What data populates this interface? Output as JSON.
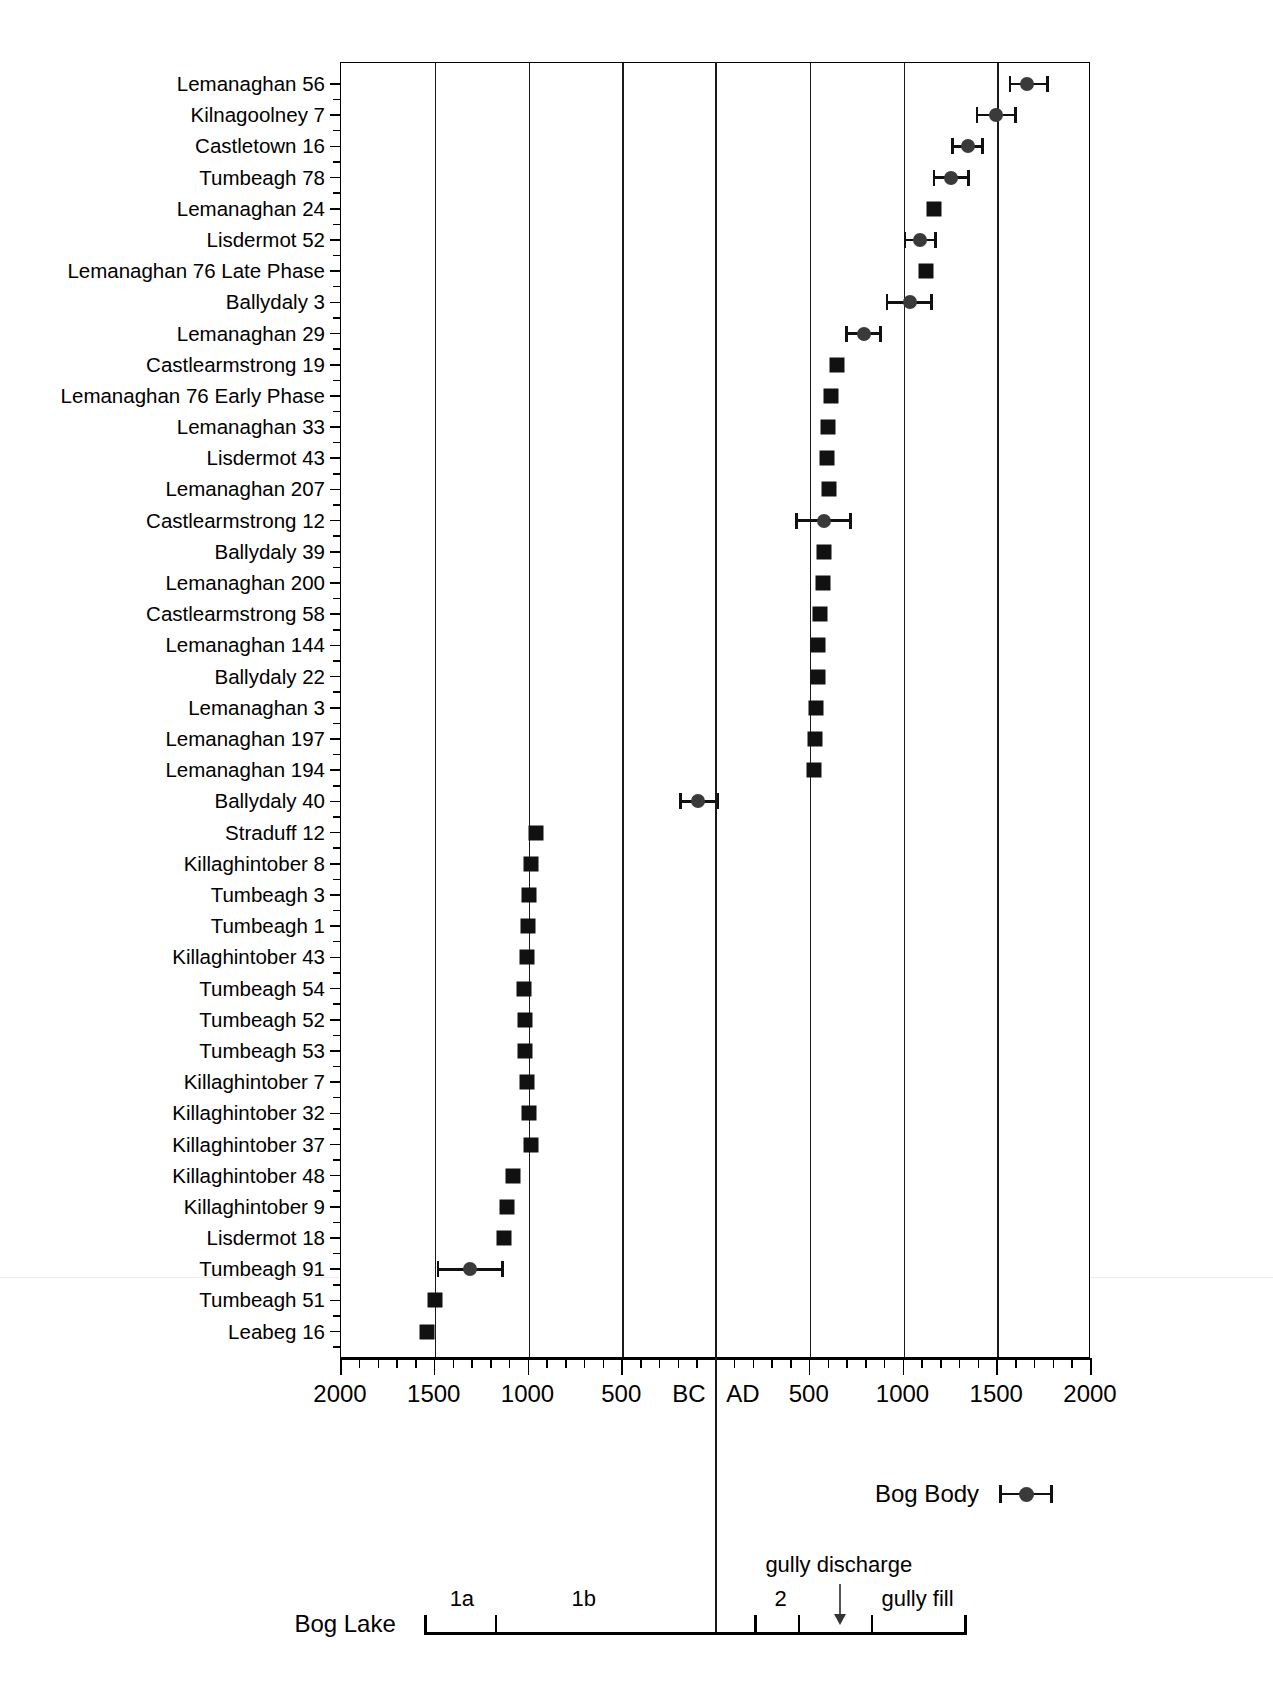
{
  "chart_data": {
    "type": "scatter",
    "title": "",
    "xlabel": "",
    "ylabel": "",
    "xlim": [
      -2000,
      2000
    ],
    "x_tick_labels": [
      "2000",
      "1500",
      "1000",
      "500",
      "BC",
      "AD",
      "500",
      "1000",
      "1500",
      "2000"
    ],
    "x_major_ticks": [
      -2000,
      -1500,
      -1000,
      -500,
      0,
      500,
      1000,
      1500,
      2000
    ],
    "x_minor_step": 100,
    "grid": "vertical",
    "legend": {
      "position": "below-right",
      "entries": [
        {
          "label": "Bog Body",
          "marker": "circle-with-error-bar"
        }
      ]
    },
    "categories": [
      "Lemanaghan 56",
      "Kilnagoolney 7",
      "Castletown 16",
      "Tumbeagh 78",
      "Lemanaghan 24",
      "Lisdermot 52",
      "Lemanaghan 76 Late Phase",
      "Ballydaly 3",
      "Lemanaghan 29",
      "Castlearmstrong 19",
      "Lemanaghan 76 Early Phase",
      "Lemanaghan 33",
      "Lisdermot 43",
      "Lemanaghan 207",
      "Castlearmstrong 12",
      "Ballydaly 39",
      "Lemanaghan 200",
      "Castlearmstrong 58",
      "Lemanaghan 144",
      "Ballydaly 22",
      "Lemanaghan 3",
      "Lemanaghan 197",
      "Lemanaghan 194",
      "Ballydaly 40",
      "Straduff 12",
      "Killaghintober 8",
      "Tumbeagh 3",
      "Tumbeagh 1",
      "Killaghintober 43",
      "Tumbeagh 54",
      "Tumbeagh 52",
      "Tumbeagh 53",
      "Killaghintober 7",
      "Killaghintober 32",
      "Killaghintober 37",
      "Killaghintober 48",
      "Killaghintober 9",
      "Lisdermot 18",
      "Tumbeagh 91",
      "Tumbeagh 51",
      "Leabeg 16"
    ],
    "points": [
      {
        "label": "Lemanaghan 56",
        "type": "bog-body",
        "value": 1660,
        "low": 1560,
        "high": 1775
      },
      {
        "label": "Kilnagoolney 7",
        "type": "bog-body",
        "value": 1495,
        "low": 1385,
        "high": 1605
      },
      {
        "label": "Castletown 16",
        "type": "bog-body",
        "value": 1345,
        "low": 1255,
        "high": 1430
      },
      {
        "label": "Tumbeagh 78",
        "type": "bog-body",
        "value": 1255,
        "low": 1155,
        "high": 1355
      },
      {
        "label": "Lemanaghan 24",
        "type": "sample",
        "value": 1165,
        "low": null,
        "high": null
      },
      {
        "label": "Lisdermot 52",
        "type": "bog-body",
        "value": 1090,
        "low": 1000,
        "high": 1180
      },
      {
        "label": "Lemanaghan 76 Late Phase",
        "type": "sample",
        "value": 1120,
        "low": null,
        "high": null
      },
      {
        "label": "Ballydaly 3",
        "type": "bog-body",
        "value": 1035,
        "low": 905,
        "high": 1155
      },
      {
        "label": "Lemanaghan 29",
        "type": "bog-body",
        "value": 790,
        "low": 690,
        "high": 885
      },
      {
        "label": "Castlearmstrong 19",
        "type": "sample",
        "value": 645,
        "low": null,
        "high": null
      },
      {
        "label": "Lemanaghan 76 Early Phase",
        "type": "sample",
        "value": 615,
        "low": null,
        "high": null
      },
      {
        "label": "Lemanaghan 33",
        "type": "sample",
        "value": 595,
        "low": null,
        "high": null
      },
      {
        "label": "Lisdermot 43",
        "type": "sample",
        "value": 590,
        "low": null,
        "high": null
      },
      {
        "label": "Lemanaghan 207",
        "type": "sample",
        "value": 600,
        "low": null,
        "high": null
      },
      {
        "label": "Castlearmstrong 12",
        "type": "bog-body",
        "value": 575,
        "low": 420,
        "high": 725
      },
      {
        "label": "Ballydaly 39",
        "type": "sample",
        "value": 575,
        "low": null,
        "high": null
      },
      {
        "label": "Lemanaghan 200",
        "type": "sample",
        "value": 570,
        "low": null,
        "high": null
      },
      {
        "label": "Castlearmstrong 58",
        "type": "sample",
        "value": 555,
        "low": null,
        "high": null
      },
      {
        "label": "Lemanaghan 144",
        "type": "sample",
        "value": 545,
        "low": null,
        "high": null
      },
      {
        "label": "Ballydaly 22",
        "type": "sample",
        "value": 545,
        "low": null,
        "high": null
      },
      {
        "label": "Lemanaghan 3",
        "type": "sample",
        "value": 535,
        "low": null,
        "high": null
      },
      {
        "label": "Lemanaghan 197",
        "type": "sample",
        "value": 530,
        "low": null,
        "high": null
      },
      {
        "label": "Lemanaghan 194",
        "type": "sample",
        "value": 520,
        "low": null,
        "high": null
      },
      {
        "label": "Ballydaly 40",
        "type": "bog-body",
        "value": -95,
        "low": -195,
        "high": 15
      },
      {
        "label": "Straduff 12",
        "type": "sample",
        "value": -960,
        "low": null,
        "high": null
      },
      {
        "label": "Killaghintober 8",
        "type": "sample",
        "value": -985,
        "low": null,
        "high": null
      },
      {
        "label": "Tumbeagh 3",
        "type": "sample",
        "value": -1000,
        "low": null,
        "high": null
      },
      {
        "label": "Tumbeagh 1",
        "type": "sample",
        "value": -1005,
        "low": null,
        "high": null
      },
      {
        "label": "Killaghintober 43",
        "type": "sample",
        "value": -1010,
        "low": null,
        "high": null
      },
      {
        "label": "Tumbeagh 54",
        "type": "sample",
        "value": -1025,
        "low": null,
        "high": null
      },
      {
        "label": "Tumbeagh 52",
        "type": "sample",
        "value": -1020,
        "low": null,
        "high": null
      },
      {
        "label": "Tumbeagh 53",
        "type": "sample",
        "value": -1020,
        "low": null,
        "high": null
      },
      {
        "label": "Killaghintober 7",
        "type": "sample",
        "value": -1010,
        "low": null,
        "high": null
      },
      {
        "label": "Killaghintober 32",
        "type": "sample",
        "value": -1000,
        "low": null,
        "high": null
      },
      {
        "label": "Killaghintober 37",
        "type": "sample",
        "value": -985,
        "low": null,
        "high": null
      },
      {
        "label": "Killaghintober 48",
        "type": "sample",
        "value": -1085,
        "low": null,
        "high": null
      },
      {
        "label": "Killaghintober 9",
        "type": "sample",
        "value": -1115,
        "low": null,
        "high": null
      },
      {
        "label": "Lisdermot 18",
        "type": "sample",
        "value": -1130,
        "low": null,
        "high": null
      },
      {
        "label": "Tumbeagh 91",
        "type": "bog-body",
        "value": -1310,
        "low": -1490,
        "high": -1130
      },
      {
        "label": "Tumbeagh 51",
        "type": "sample",
        "value": -1500,
        "low": null,
        "high": null
      },
      {
        "label": "Leabeg 16",
        "type": "sample",
        "value": -1540,
        "low": null,
        "high": null
      }
    ]
  },
  "legend": {
    "bog_body_label": "Bog Body"
  },
  "bog_lake": {
    "label": "Bog Lake",
    "phases": [
      {
        "name": "1a",
        "center": -1350
      },
      {
        "name": "1b",
        "center": -700
      },
      {
        "name": "2",
        "center": 350
      }
    ],
    "notes": [
      {
        "text": "gully discharge",
        "center": 660
      },
      {
        "text": "gully fill",
        "center": 1080
      }
    ],
    "rail_start": -1550,
    "rail_end": 1330,
    "ticks": [
      -1550,
      -1175,
      210,
      440,
      830,
      1330
    ]
  }
}
